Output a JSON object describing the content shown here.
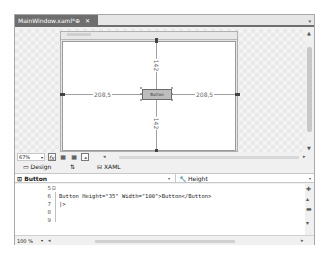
{
  "document_tab": {
    "title": "MainWindow.xaml*",
    "pin_icon": "pin-icon",
    "close_icon": "close-icon"
  },
  "tab_dropdown_icon": "▾",
  "designer": {
    "margin_top": "142",
    "margin_bottom": "142",
    "margin_left": "208,5",
    "margin_right": "208,5",
    "button_label": "Button"
  },
  "design_toolbar": {
    "zoom_value": "67%",
    "zoom_arrow": "▾",
    "icons": [
      "fx-effects-icon",
      "grid-icon",
      "snap-grid-icon",
      "snap-lines-icon"
    ]
  },
  "view_tabs": {
    "design_label": "Design",
    "swap_label": "⇅",
    "xaml_label": "XAML"
  },
  "selectors": {
    "element": "Button",
    "property": "Height",
    "arrow": "▾"
  },
  "code": {
    "lines": [
      {
        "num": "5",
        "text": ""
      },
      {
        "num": "6",
        "text": "Button Height=\"35\" Width=\"100\">Button</Button>"
      },
      {
        "num": "7",
        "text": "|>"
      },
      {
        "num": "8",
        "text": ""
      },
      {
        "num": "9",
        "text": ""
      }
    ],
    "zoom_value": "100 %",
    "zoom_arrow": "▾"
  }
}
